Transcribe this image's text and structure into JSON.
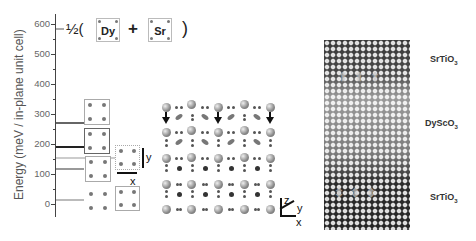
{
  "figure": {
    "energy_plot": {
      "ylabel": "Energy (meV / in-plane unit cell)",
      "yticks": [
        "600",
        "500",
        "400",
        "300",
        "200",
        "100",
        "0"
      ],
      "levels_meV": [
        600,
        275,
        190,
        155,
        115,
        15
      ],
      "equation": {
        "prefix": "½(",
        "term1": "Dy",
        "plus": "+",
        "term2": "Sr",
        "suffix": ")"
      },
      "axes_labels": {
        "x": "x",
        "y": "y"
      }
    },
    "lattice_model": {
      "axes": {
        "z": "z",
        "y": "y",
        "x": "x"
      }
    },
    "tem_image": {
      "labels": [
        {
          "text": "SrTiO",
          "sub": "3"
        },
        {
          "text": "DyScO",
          "sub": "3"
        },
        {
          "text": "SrTiO",
          "sub": "3"
        }
      ]
    }
  }
}
